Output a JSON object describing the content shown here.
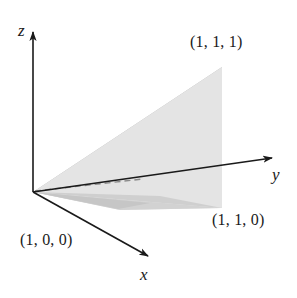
{
  "figure": {
    "background_color": "#ffffff",
    "line_color": "#1a1a1a",
    "axes": [
      {
        "id": "z",
        "label": "z",
        "name": "z-axis",
        "direction": "up"
      },
      {
        "id": "x",
        "label": "x",
        "name": "x-axis",
        "direction": "down-right-front"
      },
      {
        "id": "y",
        "label": "y",
        "name": "y-axis",
        "direction": "right"
      }
    ],
    "vertex_labels": [
      {
        "id": "p111",
        "label": "(1, 1, 1)",
        "coords": [
          1,
          1,
          1
        ]
      },
      {
        "id": "p110",
        "label": "(1, 1, 0)",
        "coords": [
          1,
          1,
          0
        ]
      },
      {
        "id": "p100",
        "label": "(1, 0, 0)",
        "coords": [
          1,
          0,
          0
        ]
      }
    ],
    "faces": [
      {
        "id": "face-back-upper",
        "name": "upper-back-face",
        "fill": "#b5b5b5"
      },
      {
        "id": "face-right-vertical",
        "name": "right-vertical-face",
        "fill": "#dcdcdc"
      },
      {
        "id": "face-front-lower",
        "name": "front-lower-face",
        "fill": "#e4e4e4"
      },
      {
        "id": "face-base-right",
        "name": "base-right-face",
        "fill": "#cfcfcf"
      },
      {
        "id": "face-base-left",
        "name": "base-left-face",
        "fill": "#d8d8d8"
      }
    ],
    "hidden_edge": {
      "id": "edge-hidden",
      "name": "hidden-edge-dashed",
      "style": "dashed",
      "color": "#8a8a8a"
    },
    "origin": {
      "x": 33,
      "y": 192
    }
  }
}
